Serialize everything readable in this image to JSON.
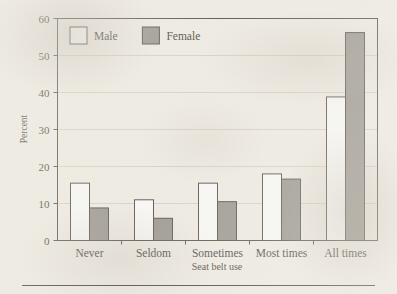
{
  "chart_data": {
    "type": "bar",
    "title": "",
    "xlabel": "Seat belt use",
    "ylabel": "Percent",
    "categories": [
      "Never",
      "Seldom",
      "Sometimes",
      "Most times",
      "All times"
    ],
    "series": [
      {
        "name": "Male",
        "color": "#ffffff",
        "values": [
          15.5,
          11.0,
          15.5,
          18.0,
          38.8
        ]
      },
      {
        "name": "Female",
        "color": "#8d8a85",
        "values": [
          8.8,
          6.0,
          10.5,
          16.6,
          56.2
        ]
      }
    ],
    "ylim": [
      0,
      60
    ],
    "yticks": [
      0,
      10,
      20,
      30,
      40,
      50,
      60
    ],
    "ytick_labels": [
      "0",
      "10",
      "20",
      "30",
      "40",
      "50",
      "60"
    ],
    "grid": true,
    "grid_axis": "y",
    "legend_position": "upper left",
    "bar_edge_color": "#3a3834",
    "axis_color": "#3a3834",
    "grid_color": "#cdc8bd"
  },
  "figure": {
    "background": "#f2efe9",
    "footer_rule": true
  }
}
